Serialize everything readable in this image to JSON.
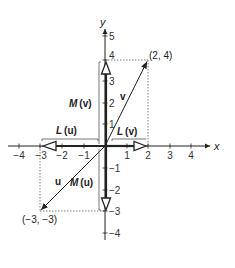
{
  "diagram": {
    "axes": {
      "x_label": "x",
      "y_label": "y",
      "x_ticks": [
        "−4",
        "−3",
        "−2",
        "−1",
        "1",
        "2",
        "3",
        "4"
      ],
      "y_ticks": [
        "5",
        "4",
        "3",
        "2",
        "1",
        "−1",
        "−2",
        "−3",
        "−4"
      ]
    },
    "points": {
      "v_end": "(2, 4)",
      "u_end": "(−3, −3)"
    },
    "vectors": {
      "v": "v",
      "u": "u"
    },
    "transforms": {
      "L_letter": "L",
      "M_letter": "M",
      "L_u_arg": "(u)",
      "L_v_arg": "(v)",
      "M_v_arg": "(v)",
      "M_u_arg": "(u)"
    },
    "colors": {
      "line": "#222222",
      "dotted": "#555555",
      "bracket": "#666666"
    }
  }
}
